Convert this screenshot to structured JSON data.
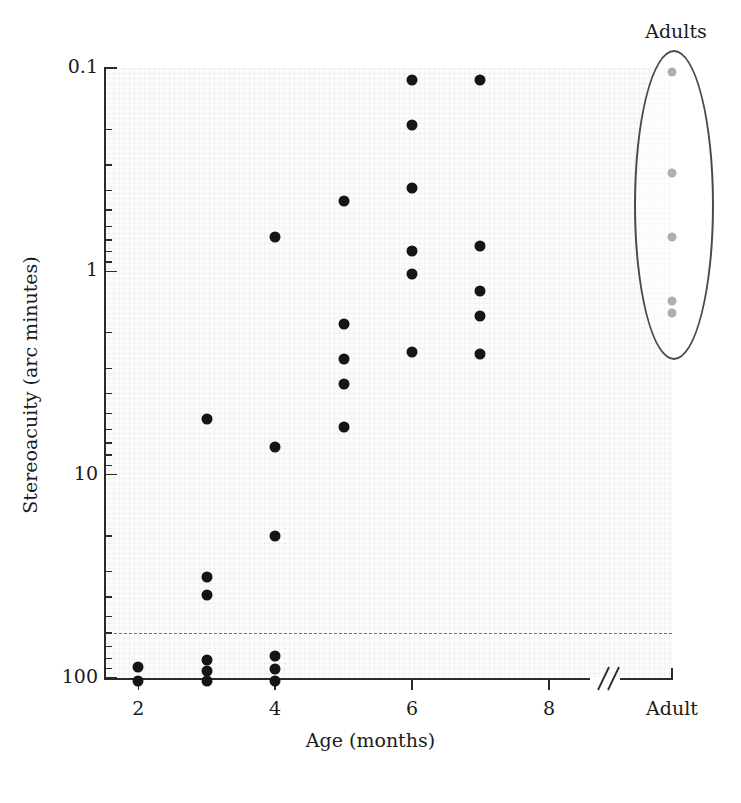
{
  "figure": {
    "background_color": "#ffffff",
    "plot_background_color": "#fcfcfc",
    "point_color": "#151515",
    "adult_point_color": "#4e4e52",
    "axis_color": "#2a2a2a",
    "criterion_line_color": "#6e6e74"
  },
  "chart_data": {
    "type": "scatter",
    "title": "",
    "xlabel": "Age (months)",
    "ylabel": "Stereoacuity (arc minutes)",
    "x_tick_labels": [
      "2",
      "4",
      "6",
      "8",
      "Adult"
    ],
    "x_tick_values": [
      2,
      4,
      6,
      8,
      "Adult"
    ],
    "xlim": [
      1.5,
      8.6
    ],
    "x_axis_break": true,
    "x_axis_break_symbol": "//",
    "y_scale": "log",
    "y_inverted": true,
    "ylim": [
      0.1,
      100
    ],
    "y_tick_labels": [
      "0.1",
      "1",
      "10",
      "100"
    ],
    "y_tick_values": [
      0.1,
      1,
      10,
      100
    ],
    "y_minor_ticks": [
      0.2,
      0.3,
      0.4,
      0.5,
      0.6,
      0.7,
      0.8,
      0.9,
      2,
      3,
      4,
      5,
      6,
      7,
      8,
      9,
      20,
      30,
      40,
      50,
      60,
      70,
      80,
      90
    ],
    "grid": true,
    "grid_style": "fine texture",
    "legend": "none",
    "annotations": [
      {
        "name": "adults-group",
        "text": "Adults",
        "type": "ellipse-callout"
      }
    ],
    "reference_lines": [
      {
        "name": "criterion-line",
        "orientation": "horizontal",
        "y": 60,
        "style": "dashed"
      }
    ],
    "series": [
      {
        "name": "Infants",
        "marker": "filled-circle",
        "color": "#151515",
        "points": [
          {
            "x": 2,
            "y": 88
          },
          {
            "x": 2,
            "y": 104
          },
          {
            "x": 3,
            "y": 5.3
          },
          {
            "x": 3,
            "y": 32
          },
          {
            "x": 3,
            "y": 39
          },
          {
            "x": 3,
            "y": 82
          },
          {
            "x": 3,
            "y": 92
          },
          {
            "x": 3,
            "y": 103
          },
          {
            "x": 4,
            "y": 0.68
          },
          {
            "x": 4,
            "y": 7.3
          },
          {
            "x": 4,
            "y": 20
          },
          {
            "x": 4,
            "y": 78
          },
          {
            "x": 4,
            "y": 90
          },
          {
            "x": 4,
            "y": 104
          },
          {
            "x": 5,
            "y": 0.45
          },
          {
            "x": 5,
            "y": 1.82
          },
          {
            "x": 5,
            "y": 2.7
          },
          {
            "x": 5,
            "y": 3.6
          },
          {
            "x": 5,
            "y": 5.8
          },
          {
            "x": 6,
            "y": 0.115
          },
          {
            "x": 6,
            "y": 0.19
          },
          {
            "x": 6,
            "y": 0.39
          },
          {
            "x": 6,
            "y": 0.79
          },
          {
            "x": 6,
            "y": 1.03
          },
          {
            "x": 6,
            "y": 2.5
          },
          {
            "x": 7,
            "y": 0.115
          },
          {
            "x": 7,
            "y": 0.75
          },
          {
            "x": 7,
            "y": 1.25
          },
          {
            "x": 7,
            "y": 1.65
          },
          {
            "x": 7,
            "y": 2.55
          }
        ]
      },
      {
        "name": "Adults",
        "marker": "filled-circle",
        "color": "#4e4e52",
        "points": [
          {
            "x": "Adult",
            "y": 0.105
          },
          {
            "x": "Adult",
            "y": 0.33
          },
          {
            "x": "Adult",
            "y": 0.68
          },
          {
            "x": "Adult",
            "y": 1.4
          },
          {
            "x": "Adult",
            "y": 1.6
          }
        ]
      }
    ]
  }
}
